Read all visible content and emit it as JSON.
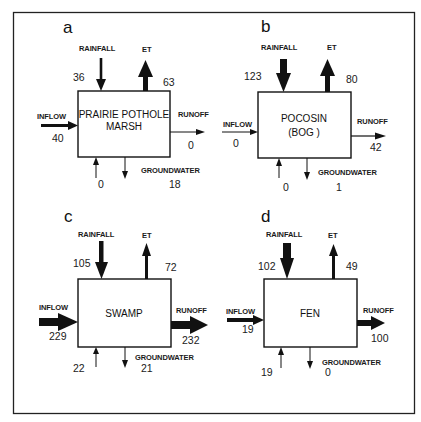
{
  "figure": {
    "panels": [
      {
        "id": "a",
        "letter": "a",
        "name_line1": "PRAIRIE POTHOLE",
        "name_line2": "MARSH",
        "labels": {
          "rainfall": "RAINFALL",
          "et": "ET",
          "inflow": "INFLOW",
          "runoff": "RUNOFF",
          "groundwater": "GROUNDWATER"
        },
        "values": {
          "rainfall": "36",
          "et": "63",
          "inflow": "40",
          "runoff": "0",
          "groundwater_in": "0",
          "groundwater_out": "18"
        }
      },
      {
        "id": "b",
        "letter": "b",
        "name_line1": "POCOSIN",
        "name_line2": "(BOG )",
        "labels": {
          "rainfall": "RAINFALL",
          "et": "ET",
          "inflow": "INFLOW",
          "runoff": "RUNOFF",
          "groundwater": "GROUNDWATER"
        },
        "values": {
          "rainfall": "123",
          "et": "80",
          "inflow": "0",
          "runoff": "42",
          "groundwater_in": "0",
          "groundwater_out": "1"
        }
      },
      {
        "id": "c",
        "letter": "c",
        "name_line1": "SWAMP",
        "name_line2": "",
        "labels": {
          "rainfall": "RAINFALL",
          "et": "ET",
          "inflow": "INFLOW",
          "runoff": "RUNOFF",
          "groundwater": "GROUNDWATER"
        },
        "values": {
          "rainfall": "105",
          "et": "72",
          "inflow": "229",
          "runoff": "232",
          "groundwater_in": "22",
          "groundwater_out": "21"
        }
      },
      {
        "id": "d",
        "letter": "d",
        "name_line1": "FEN",
        "name_line2": "",
        "labels": {
          "rainfall": "RAINFALL",
          "et": "ET",
          "inflow": "INFLOW",
          "runoff": "RUNOFF",
          "groundwater": "GROUNDWATER"
        },
        "values": {
          "rainfall": "102",
          "et": "49",
          "inflow": "19",
          "runoff": "100",
          "groundwater_in": "19",
          "groundwater_out": "0"
        }
      }
    ]
  }
}
